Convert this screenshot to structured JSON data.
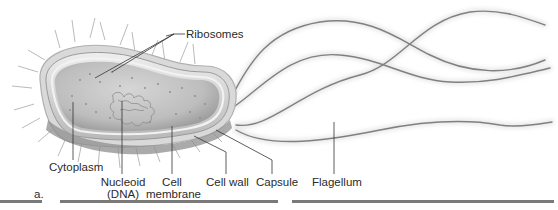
{
  "figure": {
    "panel_label": "a.",
    "colors": {
      "cytoplasm": "#c9c9c9",
      "cell_wall": "#e4e4e4",
      "capsule": "#dcdcdc",
      "lines": "#3a3a3a",
      "flagellum": "#7a7a7a",
      "text": "#2a2a2a"
    }
  },
  "labels": {
    "ribosomes": "Ribosomes",
    "cytoplasm": "Cytoplasm",
    "nucleoid_line1": "Nucleoid",
    "nucleoid_line2": "(DNA)",
    "cell_membrane_line1": "Cell",
    "cell_membrane_line2": "membrane",
    "cell_wall": "Cell wall",
    "capsule": "Capsule",
    "flagellum": "Flagellum"
  }
}
